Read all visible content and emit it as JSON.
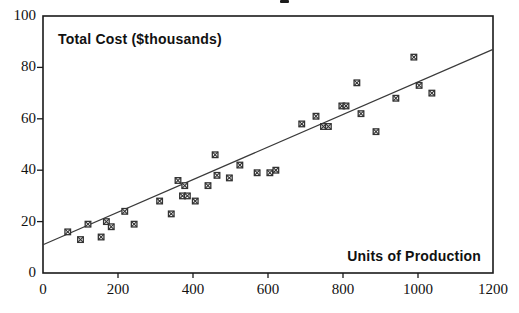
{
  "figure": {
    "y_axis_title": "Total Cost ($thousands)",
    "x_axis_title": "Units of Production"
  },
  "chart_data": {
    "type": "scatter",
    "title": "",
    "ylabel": "Total Cost ($thousands)",
    "xlabel": "Units of Production",
    "xlim": [
      0,
      1200
    ],
    "ylim": [
      0,
      100
    ],
    "x_ticks": [
      0,
      200,
      400,
      600,
      800,
      1000,
      1200
    ],
    "y_ticks": [
      0,
      20,
      40,
      60,
      80,
      100
    ],
    "grid": "off",
    "legend": "none",
    "marker_style": "boxed-x-square",
    "points": [
      [
        66,
        16
      ],
      [
        100,
        13
      ],
      [
        120,
        19
      ],
      [
        155,
        14
      ],
      [
        169,
        20
      ],
      [
        182,
        18
      ],
      [
        218,
        24
      ],
      [
        243,
        19
      ],
      [
        311,
        28
      ],
      [
        342,
        23
      ],
      [
        360,
        36
      ],
      [
        372,
        30
      ],
      [
        378,
        34
      ],
      [
        385,
        30
      ],
      [
        406,
        28
      ],
      [
        440,
        34
      ],
      [
        459,
        46
      ],
      [
        464,
        38
      ],
      [
        497,
        37
      ],
      [
        525,
        42
      ],
      [
        571,
        39
      ],
      [
        605,
        39
      ],
      [
        621,
        40
      ],
      [
        690,
        58
      ],
      [
        728,
        61
      ],
      [
        748,
        57
      ],
      [
        761,
        57
      ],
      [
        797,
        65
      ],
      [
        808,
        65
      ],
      [
        837,
        74
      ],
      [
        848,
        62
      ],
      [
        888,
        55
      ],
      [
        941,
        68
      ],
      [
        989,
        84
      ],
      [
        1003,
        73
      ],
      [
        1037,
        70
      ]
    ],
    "regression_line": {
      "x": [
        0,
        1200
      ],
      "y": [
        11,
        87
      ]
    },
    "colors": {
      "marker": "#333333",
      "line": "#3a3a3a",
      "axis": "#1a1a1a",
      "text": "#111111"
    }
  }
}
